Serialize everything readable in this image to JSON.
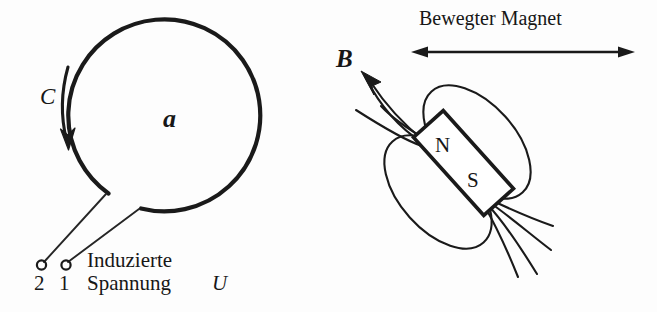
{
  "figure": {
    "background_color": "#fdfdfd",
    "ink_color": "#1a1a1a"
  },
  "loop": {
    "area_label": "a",
    "current_label": "C",
    "center": {
      "x": 176,
      "y": 124
    },
    "radius": 96
  },
  "terminals": {
    "left_label": "2",
    "right_label": "1",
    "voltage_line1": "Induzierte",
    "voltage_line2": "Spannung",
    "voltage_symbol": "U"
  },
  "magnet": {
    "caption": "Bewegter Magnet",
    "north_label": "N",
    "south_label": "S",
    "field_label": "B",
    "tilt_degrees": 48
  }
}
